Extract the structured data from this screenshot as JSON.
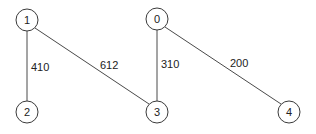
{
  "diagram": {
    "type": "weighted-undirected-graph",
    "nodes": [
      {
        "id": "0",
        "label": "0",
        "x": 157,
        "y": 19
      },
      {
        "id": "1",
        "label": "1",
        "x": 27,
        "y": 20
      },
      {
        "id": "2",
        "label": "2",
        "x": 27,
        "y": 112
      },
      {
        "id": "3",
        "label": "3",
        "x": 157,
        "y": 112
      },
      {
        "id": "4",
        "label": "4",
        "x": 289,
        "y": 112
      }
    ],
    "edges": [
      {
        "from": "1",
        "to": "2",
        "weight": "410",
        "label_x": 31,
        "label_y": 71
      },
      {
        "from": "1",
        "to": "3",
        "weight": "612",
        "label_x": 100,
        "label_y": 69
      },
      {
        "from": "0",
        "to": "3",
        "weight": "310",
        "label_x": 161,
        "label_y": 68
      },
      {
        "from": "0",
        "to": "4",
        "weight": "200",
        "label_x": 230,
        "label_y": 67
      }
    ]
  },
  "colors": {
    "line": "#4a4a4a",
    "node_stroke": "#3a3a3a",
    "text": "#222222",
    "background": "#ffffff"
  }
}
